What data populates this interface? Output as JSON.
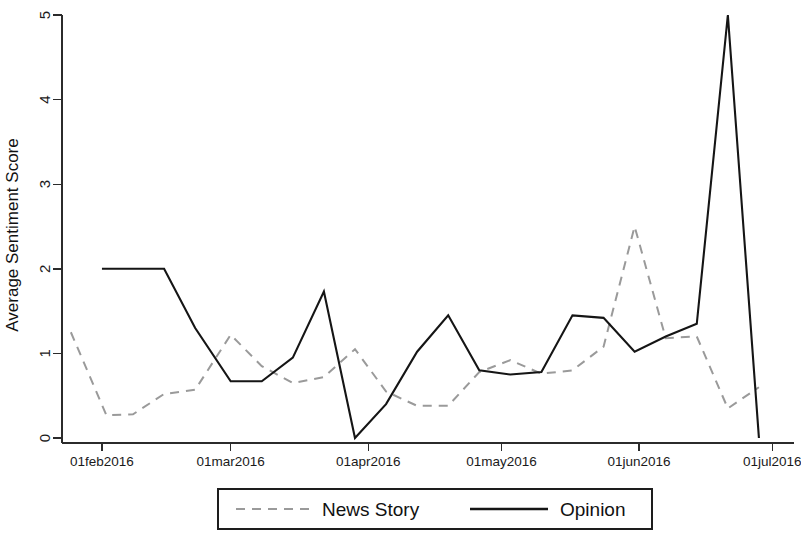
{
  "chart_data": {
    "type": "line",
    "title": "",
    "xlabel": "",
    "ylabel": "Average Sentiment Score",
    "ylim": [
      0,
      5
    ],
    "yticks": [
      0,
      1,
      2,
      3,
      4,
      5
    ],
    "ytick_labels": [
      "0",
      "1",
      "2",
      "3",
      "4",
      "5"
    ],
    "xtick_labels": [
      "01feb2016",
      "01mar2016",
      "01apr2016",
      "01may2016",
      "01jun2016",
      "01jul2016"
    ],
    "xtick_days": [
      31,
      60,
      91,
      121,
      152,
      182
    ],
    "xlim_days": [
      22,
      186
    ],
    "grid": false,
    "legend_position": "bottom-outside",
    "series": [
      {
        "name": "News Story",
        "style": "dashed",
        "color": "#9a9a9a",
        "x_days": [
          24,
          32,
          38,
          45,
          52,
          60,
          67,
          74,
          81,
          88,
          95,
          102,
          109,
          116,
          123,
          130,
          137,
          144,
          151,
          158,
          165,
          172,
          179
        ],
        "values": [
          1.25,
          0.27,
          0.28,
          0.52,
          0.57,
          1.22,
          0.85,
          0.65,
          0.72,
          1.05,
          0.55,
          0.38,
          0.38,
          0.78,
          0.92,
          0.76,
          0.8,
          1.08,
          2.5,
          1.18,
          1.2,
          0.35,
          0.6
        ]
      },
      {
        "name": "Opinion",
        "style": "solid",
        "color": "#151515",
        "x_days": [
          31,
          38,
          45,
          52,
          60,
          67,
          74,
          81,
          88,
          95,
          102,
          109,
          116,
          123,
          130,
          137,
          144,
          151,
          158,
          165,
          172,
          179
        ],
        "values": [
          2.0,
          2.0,
          2.0,
          1.3,
          0.67,
          0.67,
          0.95,
          1.73,
          0.0,
          0.4,
          1.02,
          1.45,
          0.8,
          0.75,
          0.78,
          1.45,
          1.42,
          1.02,
          1.2,
          1.35,
          5.0,
          0.0
        ]
      }
    ],
    "legend_entries": [
      {
        "label": "News Story",
        "style": "dashed"
      },
      {
        "label": "Opinion",
        "style": "solid"
      }
    ]
  }
}
